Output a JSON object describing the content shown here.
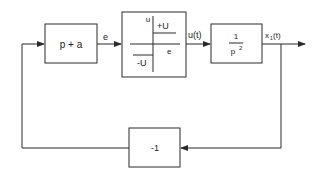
{
  "diagram": {
    "type": "block-diagram",
    "blocks": [
      {
        "id": "lead",
        "label": "p + a"
      },
      {
        "id": "relay",
        "axis_y_label": "u",
        "axis_x_label": "e",
        "upper_level": "+U",
        "lower_level": "-U"
      },
      {
        "id": "plant",
        "numerator": "1",
        "denominator": "p",
        "denominator_exp": "2"
      },
      {
        "id": "feedback",
        "label": "-1"
      }
    ],
    "signals": {
      "error": "e",
      "control": "u(t)",
      "output_base": "x",
      "output_sub": "1",
      "output_arg": "(t)"
    },
    "colors": {
      "line": "#2a2a2a",
      "background": "#ffffff"
    }
  }
}
